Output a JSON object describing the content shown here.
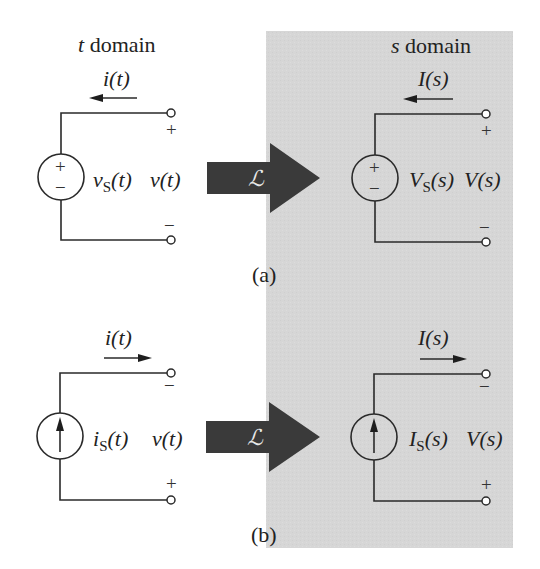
{
  "colors": {
    "panel": "#d6d6d6",
    "big_arrow": "#3a3a3a",
    "ink": "#222222"
  },
  "headers": {
    "t_domain_var": "t",
    "t_domain_word": " domain",
    "s_domain_var": "s",
    "s_domain_word": " domain"
  },
  "transform_symbol": "ℒ",
  "panel_a": {
    "caption": "(a)",
    "t_side": {
      "current_label": "i(t)",
      "current_direction": "left",
      "source_type": "voltage",
      "source_label_main": "v",
      "source_label_sub": "S",
      "source_label_arg": "(t)",
      "voltage_label": "v(t)",
      "top_sign": "+",
      "bottom_sign": "−",
      "source_plus": "+",
      "source_minus": "−"
    },
    "s_side": {
      "current_label": "I(s)",
      "current_direction": "left",
      "source_type": "voltage",
      "source_label_main": "V",
      "source_label_sub": "S",
      "source_label_arg": "(s)",
      "voltage_label": "V(s)",
      "top_sign": "+",
      "bottom_sign": "−",
      "source_plus": "+",
      "source_minus": "−"
    }
  },
  "panel_b": {
    "caption": "(b)",
    "t_side": {
      "current_label": "i(t)",
      "current_direction": "right",
      "source_type": "current",
      "source_label_main": "i",
      "source_label_sub": "S",
      "source_label_arg": "(t)",
      "voltage_label": "v(t)",
      "top_sign": "−",
      "bottom_sign": "+"
    },
    "s_side": {
      "current_label": "I(s)",
      "current_direction": "right",
      "source_type": "current",
      "source_label_main": "I",
      "source_label_sub": "S",
      "source_label_arg": "(s)",
      "voltage_label": "V(s)",
      "top_sign": "−",
      "bottom_sign": "+"
    }
  }
}
